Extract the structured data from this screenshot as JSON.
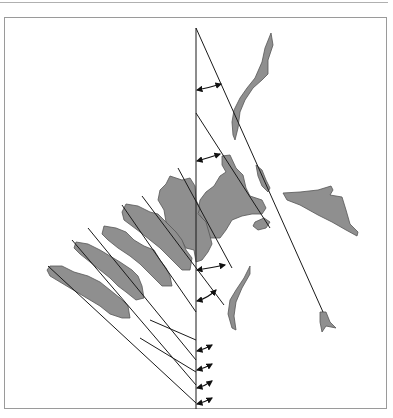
{
  "figure": {
    "type": "spinal-alignment-diagram",
    "colors": {
      "bone_fill": "#8f8f8f",
      "line": "#1a1a1a",
      "frame": "#9a9a9a",
      "background": "#ffffff"
    },
    "vertical_reference_x": 196,
    "angle_markers": 9,
    "vertebrae_count": 6,
    "text_labels": []
  }
}
